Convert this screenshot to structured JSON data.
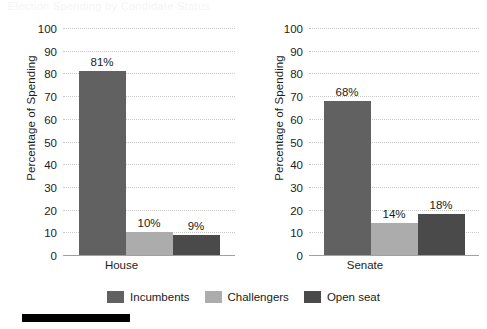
{
  "page": {
    "bleed_text": "Election Spending by Candidate Status",
    "redaction_label": "source-redaction-bar"
  },
  "legend": {
    "items": [
      {
        "label": "Incumbents",
        "color": "#616161"
      },
      {
        "label": "Challengers",
        "color": "#acacac"
      },
      {
        "label": "Open seat",
        "color": "#4a4a4a"
      }
    ]
  },
  "axis": {
    "ylabel": "Percentage of Spending",
    "yticks": [
      "0",
      "10",
      "20",
      "30",
      "40",
      "50",
      "60",
      "70",
      "80",
      "90",
      "100"
    ]
  },
  "chart_data": [
    {
      "type": "bar",
      "title": "House",
      "xlabel": "House",
      "ylabel": "Percentage of Spending",
      "categories": [
        "Incumbents",
        "Challengers",
        "Open seat"
      ],
      "values": [
        81,
        10,
        9
      ],
      "value_labels": [
        "81%",
        "10%",
        "9%"
      ],
      "colors": [
        "#616161",
        "#acacac",
        "#4a4a4a"
      ],
      "ylim": [
        0,
        100
      ],
      "ytick_step": 10,
      "grid": true,
      "legend_position": "bottom"
    },
    {
      "type": "bar",
      "title": "Senate",
      "xlabel": "Senate",
      "ylabel": "Percentage of Spending",
      "categories": [
        "Incumbents",
        "Challengers",
        "Open seat"
      ],
      "values": [
        68,
        14,
        18
      ],
      "value_labels": [
        "68%",
        "14%",
        "18%"
      ],
      "colors": [
        "#616161",
        "#acacac",
        "#4a4a4a"
      ],
      "ylim": [
        0,
        100
      ],
      "ytick_step": 10,
      "grid": true,
      "legend_position": "bottom"
    }
  ]
}
